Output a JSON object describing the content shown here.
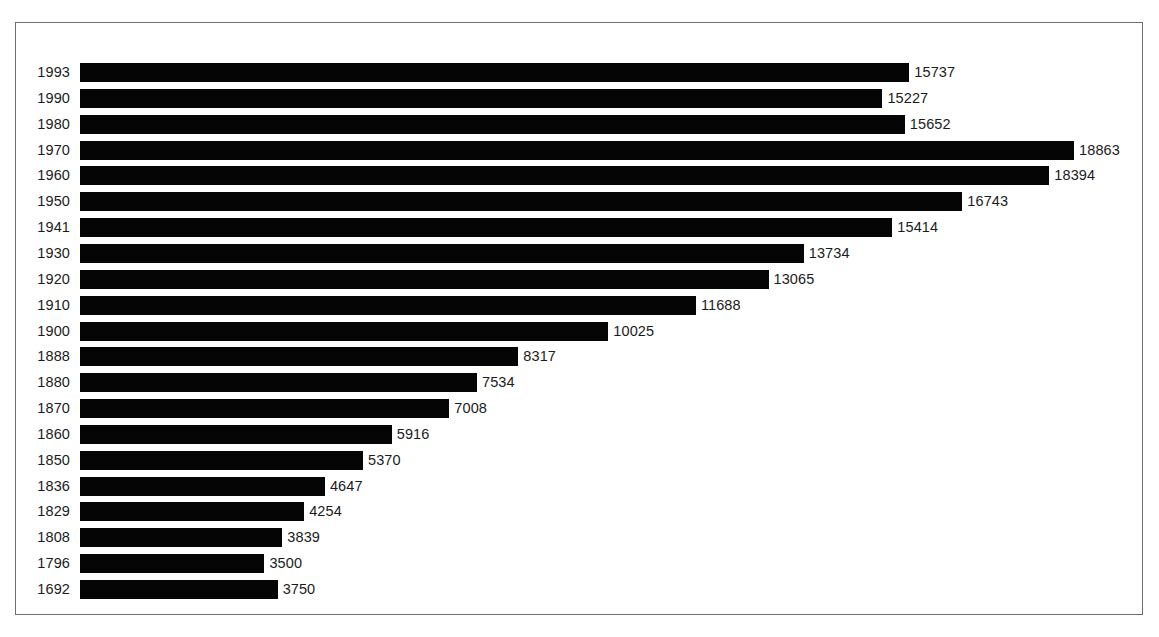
{
  "chart_data": {
    "type": "bar",
    "orientation": "horizontal",
    "title": "",
    "subtitle": "",
    "xlabel": "",
    "ylabel": "",
    "grid": false,
    "legend": null,
    "xlim": [
      0,
      18863
    ],
    "categories": [
      "1993",
      "1990",
      "1980",
      "1970",
      "1960",
      "1950",
      "1941",
      "1930",
      "1920",
      "1910",
      "1900",
      "1888",
      "1880",
      "1870",
      "1860",
      "1850",
      "1836",
      "1829",
      "1808",
      "1796",
      "1692"
    ],
    "values": [
      15737,
      15227,
      15652,
      18863,
      18394,
      16743,
      15414,
      13734,
      13065,
      11688,
      10025,
      8317,
      7534,
      7008,
      5916,
      5370,
      4647,
      4254,
      3839,
      3500,
      3750
    ],
    "value_labels": [
      "15737",
      "15227",
      "15652",
      "18863",
      "18394",
      "16743",
      "15414",
      "13734",
      "13065",
      "11688",
      "10025",
      "8317",
      "7534",
      "7008",
      "5916",
      "5370",
      "4647",
      "4254",
      "3839",
      "3500",
      "3750"
    ],
    "bar_color": "#050505",
    "text_color": "#1b1b1d",
    "background_color": "#ffffff",
    "frame_color": "#6e6e70",
    "rows": [
      {
        "category": "1993",
        "value": 15737,
        "label": "15737"
      },
      {
        "category": "1990",
        "value": 15227,
        "label": "15227"
      },
      {
        "category": "1980",
        "value": 15652,
        "label": "15652"
      },
      {
        "category": "1970",
        "value": 18863,
        "label": "18863"
      },
      {
        "category": "1960",
        "value": 18394,
        "label": "18394"
      },
      {
        "category": "1950",
        "value": 16743,
        "label": "16743"
      },
      {
        "category": "1941",
        "value": 15414,
        "label": "15414"
      },
      {
        "category": "1930",
        "value": 13734,
        "label": "13734"
      },
      {
        "category": "1920",
        "value": 13065,
        "label": "13065"
      },
      {
        "category": "1910",
        "value": 11688,
        "label": "11688"
      },
      {
        "category": "1900",
        "value": 10025,
        "label": "10025"
      },
      {
        "category": "1888",
        "value": 8317,
        "label": "8317"
      },
      {
        "category": "1880",
        "value": 7534,
        "label": "7534"
      },
      {
        "category": "1870",
        "value": 7008,
        "label": "7008"
      },
      {
        "category": "1860",
        "value": 5916,
        "label": "5916"
      },
      {
        "category": "1850",
        "value": 5370,
        "label": "5370"
      },
      {
        "category": "1836",
        "value": 4647,
        "label": "4647"
      },
      {
        "category": "1829",
        "value": 4254,
        "label": "4254"
      },
      {
        "category": "1808",
        "value": 3839,
        "label": "3839"
      },
      {
        "category": "1796",
        "value": 3500,
        "label": "3500"
      },
      {
        "category": "1692",
        "value": 3750,
        "label": "3750"
      }
    ]
  },
  "layout": {
    "row_pitch_px": 25.85,
    "bar_height_px": 19,
    "first_row_top_px": 40,
    "px_per_unit": 0.0527,
    "value_label_gap_px": 5
  }
}
